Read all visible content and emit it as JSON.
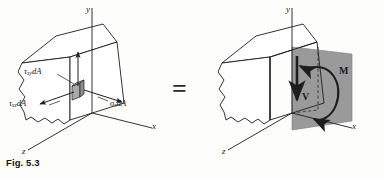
{
  "figure": {
    "caption": "Fig. 5.3",
    "equals_sign": "=",
    "colors": {
      "line": "#1d1d1d",
      "section_plane_fill": "#9a9a9a",
      "element_fill": "#a8a8a8",
      "background": "#fdfdfc"
    }
  },
  "left_diagram": {
    "name": "stress-distribution-on-section",
    "axes": {
      "y_label": "y",
      "x_label": "x",
      "z_label": "z"
    },
    "stress_labels": [
      {
        "id": "tau-xy",
        "symbol": "τ",
        "subscript": "xy",
        "suffix": "dA",
        "full": "τxy dA"
      },
      {
        "id": "tau-xz",
        "symbol": "τ",
        "subscript": "xz",
        "suffix": "dA",
        "full": "τxz dA"
      },
      {
        "id": "sigma-x",
        "symbol": "σ",
        "subscript": "x",
        "suffix": "dA",
        "full": "σx dA"
      }
    ]
  },
  "right_diagram": {
    "name": "resultant-shear-and-moment",
    "axes": {
      "y_label": "y",
      "x_label": "x",
      "z_label": "z"
    },
    "resultants": [
      {
        "id": "shear-force",
        "label": "V",
        "kind": "force-arrow"
      },
      {
        "id": "bending-moment",
        "label": "M",
        "kind": "moment-arc"
      }
    ]
  }
}
